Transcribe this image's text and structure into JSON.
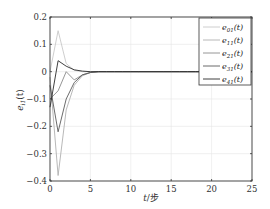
{
  "chart_data": {
    "type": "line",
    "title": "",
    "xlabel": "t/步",
    "ylabel": "e_{i1}(t)",
    "xlim": [
      0,
      25
    ],
    "ylim": [
      -0.4,
      0.2
    ],
    "xticks": [
      0,
      5,
      10,
      15,
      20,
      25
    ],
    "yticks": [
      0.2,
      0.1,
      0,
      -0.1,
      -0.2,
      -0.3,
      -0.4
    ],
    "xtick_labels": [
      "0",
      "5",
      "10",
      "15",
      "20",
      "25"
    ],
    "ytick_labels": [
      "0.2",
      "0.1",
      "0",
      "−0.1",
      "−0.2",
      "−0.3",
      "−0.4"
    ],
    "grid": true,
    "legend_position": "upper right",
    "x": [
      0,
      1,
      2,
      3,
      4,
      5,
      6,
      7,
      8,
      9,
      10,
      11,
      12,
      13,
      14,
      15,
      16,
      17,
      18,
      19,
      20,
      21,
      22,
      23,
      24,
      25
    ],
    "series": [
      {
        "name": "e01(t)",
        "color": "#c8c8c8",
        "values": [
          0.0,
          0.15,
          0.03,
          0.005,
          0.0,
          0,
          0,
          0,
          0,
          0,
          0,
          0,
          0,
          0,
          0,
          0,
          0,
          0,
          0,
          0,
          0,
          0,
          0,
          0,
          0,
          0
        ]
      },
      {
        "name": "e11(t)",
        "color": "#b0b0b0",
        "values": [
          -0.02,
          -0.38,
          -0.14,
          -0.05,
          -0.015,
          -0.003,
          0,
          0,
          0,
          0,
          0,
          0,
          0,
          0,
          0,
          0,
          0,
          0,
          0,
          0,
          0,
          0,
          0,
          0,
          0,
          0
        ]
      },
      {
        "name": "e21(t)",
        "color": "#8a8a8a",
        "values": [
          -0.1,
          -0.07,
          0.0,
          -0.03,
          -0.012,
          -0.003,
          0,
          0,
          0,
          0,
          0,
          0,
          0,
          0,
          0,
          0,
          0,
          0,
          0,
          0,
          0,
          0,
          0,
          0,
          0,
          0
        ]
      },
      {
        "name": "e31(t)",
        "color": "#5a5a5a",
        "values": [
          -0.05,
          -0.22,
          -0.1,
          -0.04,
          -0.012,
          -0.003,
          0,
          0,
          0,
          0,
          0,
          0,
          0,
          0,
          0,
          0,
          0,
          0,
          0,
          0,
          0,
          0,
          0,
          0,
          0,
          0
        ]
      },
      {
        "name": "e41(t)",
        "color": "#2a2a2a",
        "values": [
          -0.13,
          0.04,
          0.02,
          0.007,
          0.002,
          0.0,
          0,
          0,
          0,
          0,
          0,
          0,
          0,
          0,
          0,
          0,
          0,
          0,
          0,
          0,
          0,
          0,
          0,
          0,
          0,
          0
        ]
      }
    ]
  },
  "legend": {
    "items": [
      {
        "label": "e01(t)",
        "sub": "01"
      },
      {
        "label": "e11(t)",
        "sub": "11"
      },
      {
        "label": "e21(t)",
        "sub": "21"
      },
      {
        "label": "e31(t)",
        "sub": "31"
      },
      {
        "label": "e41(t)",
        "sub": "41"
      }
    ]
  },
  "labels": {
    "xlabel_prefix": "t",
    "xlabel_suffix": "/步",
    "ylabel_base": "e",
    "ylabel_sub": "i1",
    "ylabel_arg": "(t)"
  }
}
